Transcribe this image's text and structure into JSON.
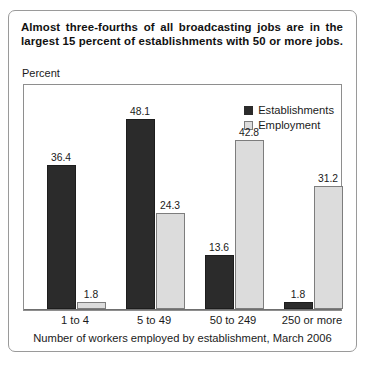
{
  "card": {
    "title": "Almost three-fourths of all broadcasting jobs are in the largest 15 percent of establishments with 50 or more jobs.",
    "axis_unit": "Percent"
  },
  "chart_data": {
    "type": "bar",
    "title": "Almost three-fourths of all broadcasting jobs are in the largest 15 percent of establishments with 50 or more jobs.",
    "categories": [
      "1 to 4",
      "5 to 49",
      "50 to 249",
      "250 or more"
    ],
    "series": [
      {
        "name": "Establishments",
        "color": "#2b2b2b",
        "values": [
          36.4,
          48.1,
          13.6,
          1.8
        ],
        "labels": [
          "36.4",
          "48.1",
          "13.6",
          "1.8"
        ]
      },
      {
        "name": "Employment",
        "color": "#dcdcdc",
        "values": [
          1.8,
          24.3,
          42.8,
          31.2
        ],
        "labels": [
          "1.8",
          "24.3",
          "42.8",
          "31.2"
        ]
      }
    ],
    "xlabel": "Number of workers employed by establishment, March 2006",
    "ylabel": "Percent",
    "ylim": [
      0,
      52
    ],
    "grid": false,
    "legend_position": "top-right"
  }
}
